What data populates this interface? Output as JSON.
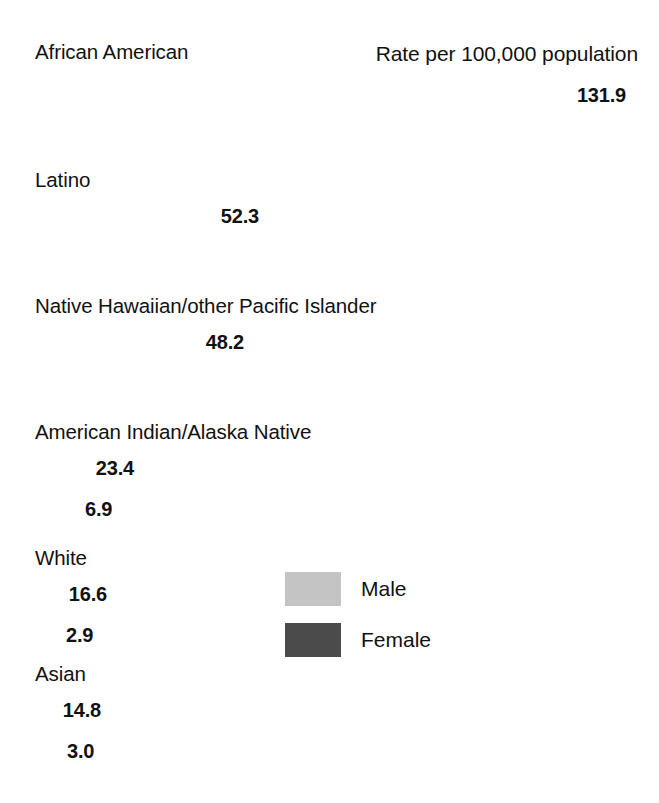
{
  "header": {
    "rate_note": "Rate per 100,000 population"
  },
  "legend": {
    "items": [
      {
        "label": "Male",
        "color": "#c4c4c4",
        "key": "male"
      },
      {
        "label": "Female",
        "color": "#4b4b4b",
        "key": "female"
      }
    ]
  },
  "chart_data": {
    "type": "bar",
    "title": "",
    "subtitle": "",
    "xlabel": "Rate per 100,000 population",
    "ylabel": "",
    "orientation": "horizontal",
    "grid": false,
    "legend_position": "center-right",
    "xlim": [
      0,
      131.9
    ],
    "categories": [
      "African American",
      "Latino",
      "Native Hawaiian/other Pacific Islander",
      "American Indian/Alaska Native",
      "White",
      "Asian"
    ],
    "series": [
      {
        "name": "Male",
        "color": "#c4c4c4",
        "values": [
          131.9,
          52.3,
          48.2,
          23.4,
          16.6,
          14.8
        ],
        "labels": [
          "131.9",
          "52.3",
          "48.2",
          "23.4",
          "16.6",
          "14.8"
        ]
      },
      {
        "name": "Female",
        "color": "#4b4b4b",
        "values": [
          56.0,
          13.3,
          10.6,
          6.9,
          2.9,
          3.0
        ],
        "labels": [
          "56.0",
          "13.3",
          "10.6",
          "6.9",
          "2.9",
          "3.0"
        ]
      }
    ],
    "annotations": [
      "Rate per 100,000 population"
    ]
  },
  "groups": [
    {
      "label": "African American",
      "label_top": 40,
      "male": {
        "value": "131.9",
        "width": 596,
        "top": 77,
        "height": 36,
        "label_pos": "inside-dark",
        "label_right": 12
      },
      "female": {
        "value": "56.0",
        "width": 253,
        "top": 113,
        "height": 41,
        "label_pos": "inside",
        "label_right": 14
      }
    },
    {
      "label": "Latino",
      "label_top": 168,
      "male": {
        "value": "52.3",
        "width": 231,
        "top": 196,
        "height": 40,
        "label_pos": "inside-dark",
        "label_right": 14
      },
      "female": {
        "value": "13.3",
        "width": 60,
        "top": 236,
        "height": 41,
        "label_pos": "inside",
        "label_left": 6
      }
    },
    {
      "label": "Native Hawaiian/other Pacific Islander",
      "label_top": 294,
      "male": {
        "value": "48.2",
        "width": 216,
        "top": 322,
        "height": 40,
        "label_pos": "inside-dark",
        "label_right": 14
      },
      "female": {
        "value": "10.6",
        "width": 48,
        "top": 362,
        "height": 41,
        "label_pos": "inside",
        "label_left": 4
      }
    },
    {
      "label": "American Indian/Alaska Native",
      "label_top": 420,
      "male": {
        "value": "23.4",
        "width": 104,
        "top": 448,
        "height": 40,
        "label_pos": "inside-dark",
        "label_right": 12
      },
      "female": {
        "value": "6.9",
        "width": 33,
        "top": 488,
        "height": 41,
        "label_pos": "outside",
        "label_offset": 10
      }
    },
    {
      "label": "White",
      "label_top": 546,
      "male": {
        "value": "16.6",
        "width": 75,
        "top": 574,
        "height": 40,
        "label_pos": "inside-dark",
        "label_right": 10
      },
      "female": {
        "value": "2.9",
        "width": 14,
        "top": 614,
        "height": 41,
        "label_pos": "outside",
        "label_offset": 10
      }
    },
    {
      "label": "Asian",
      "label_top": 662,
      "male": {
        "value": "14.8",
        "width": 67,
        "top": 690,
        "height": 40,
        "label_pos": "inside-dark",
        "label_right": 8
      },
      "female": {
        "value": "3.0",
        "width": 15,
        "top": 730,
        "height": 41,
        "label_pos": "outside",
        "label_offset": 10
      }
    }
  ]
}
